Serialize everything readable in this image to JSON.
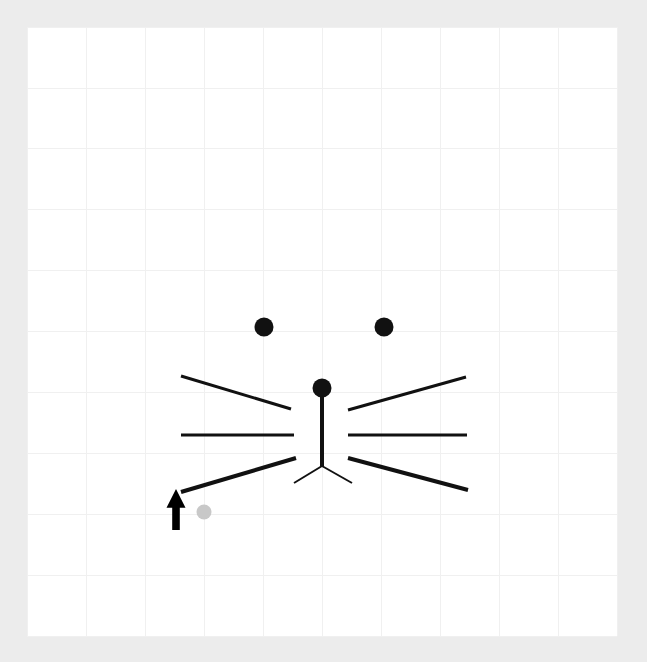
{
  "app": {
    "title": "Drawing Canvas",
    "background_color": "#ececec",
    "canvas_color": "#ffffff"
  },
  "canvas": {
    "name": "drawing-canvas",
    "x": 27,
    "y": 27,
    "width": 590,
    "height": 609,
    "grid": {
      "visible": true,
      "spacing": 59,
      "color": "#f0f0f0",
      "columns": 10,
      "rows": 10,
      "x_lines": [
        27,
        86,
        145,
        204,
        263,
        322,
        381,
        440,
        499,
        558,
        617
      ],
      "y_lines": [
        27,
        88,
        148,
        209,
        270,
        331,
        392,
        453,
        514,
        575,
        636
      ]
    }
  },
  "drawing": {
    "name": "cat-face-sketch",
    "stroke_color": "#111111",
    "dots": [
      {
        "name": "left-eye-dot",
        "cx": 264,
        "cy": 327,
        "r": 9.5,
        "fill": "#111111"
      },
      {
        "name": "right-eye-dot",
        "cx": 384,
        "cy": 327,
        "r": 9.5,
        "fill": "#111111"
      },
      {
        "name": "nose-dot",
        "cx": 322,
        "cy": 388,
        "r": 9.5,
        "fill": "#111111"
      }
    ],
    "strokes": [
      {
        "name": "whisker-upper-left",
        "x1": 181,
        "y1": 376,
        "x2": 291,
        "y2": 409,
        "width": 3
      },
      {
        "name": "whisker-middle-left",
        "x1": 181,
        "y1": 435,
        "x2": 294,
        "y2": 435,
        "width": 3
      },
      {
        "name": "whisker-lower-left",
        "x1": 181,
        "y1": 492,
        "x2": 296,
        "y2": 458,
        "width": 4
      },
      {
        "name": "whisker-upper-right",
        "x1": 348,
        "y1": 410,
        "x2": 466,
        "y2": 377,
        "width": 3
      },
      {
        "name": "whisker-middle-right",
        "x1": 348,
        "y1": 435,
        "x2": 467,
        "y2": 435,
        "width": 3
      },
      {
        "name": "whisker-lower-right",
        "x1": 348,
        "y1": 458,
        "x2": 468,
        "y2": 490,
        "width": 4
      },
      {
        "name": "nose-bridge-line",
        "x1": 322,
        "y1": 393,
        "x2": 322,
        "y2": 466,
        "width": 4
      },
      {
        "name": "mouth-left-line",
        "x1": 322,
        "y1": 466,
        "x2": 294,
        "y2": 483,
        "width": 2
      },
      {
        "name": "mouth-right-line",
        "x1": 322,
        "y1": 466,
        "x2": 352,
        "y2": 483,
        "width": 2
      }
    ]
  },
  "cursor": {
    "name": "pointer-arrow",
    "color": "#000000",
    "tip_x": 176,
    "tip_y": 489,
    "width": 19,
    "height": 41
  },
  "hover_marker": {
    "name": "hover-point-indicator",
    "cx": 204,
    "cy": 512,
    "r": 7.5,
    "fill": "#c8c8c8"
  }
}
